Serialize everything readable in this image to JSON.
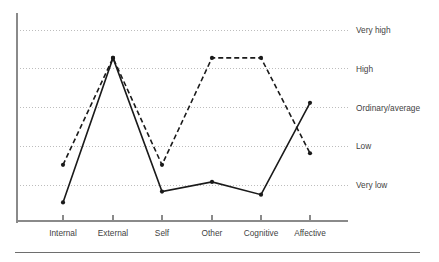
{
  "chart_data": {
    "type": "line",
    "title": "",
    "xlabel": "",
    "ylabel": "",
    "grid": true,
    "legend_position": "none",
    "categories": [
      "Internal",
      "External",
      "Self",
      "Other",
      "Cognitive",
      "Affective"
    ],
    "y_tick_labels": [
      "Very high",
      "High",
      "Ordinary/average",
      "Low",
      "Very low"
    ],
    "y_tick_values": [
      5,
      4,
      3,
      2,
      1
    ],
    "ylim": [
      0.35,
      5.6
    ],
    "series": [
      {
        "name": "solid-line",
        "style": "solid",
        "marker": "filled-circle",
        "color": "#1a1a1a",
        "values": [
          0.55,
          4.28,
          0.83,
          1.08,
          0.75,
          3.12
        ]
      },
      {
        "name": "dashed-line",
        "style": "dashed",
        "marker": "filled-circle",
        "color": "#1a1a1a",
        "values": [
          1.52,
          4.28,
          1.52,
          4.28,
          4.28,
          1.82
        ]
      }
    ],
    "y_tick_labels_detail": [
      {
        "label": "Very high",
        "value": 5
      },
      {
        "label": "High",
        "value": 4
      },
      {
        "label": "Ordinary/average",
        "value": 3
      },
      {
        "label": "Low",
        "value": 2
      },
      {
        "label": "Very low",
        "value": 1
      }
    ]
  },
  "axes": {
    "y_axis_name": "y-axis",
    "x_axis_name": "x-axis"
  },
  "colors": {
    "axis": "#8a8a8a",
    "grid": "#bdbdbd",
    "line": "#1a1a1a",
    "text": "#3f3f3f",
    "rule": "#6e6e6e"
  }
}
